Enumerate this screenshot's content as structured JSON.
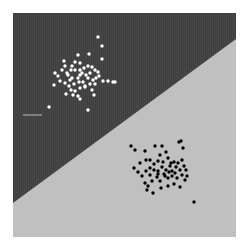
{
  "chart_data": {
    "type": "scatter",
    "title": "",
    "xlabel": "",
    "ylabel": "",
    "grid": false,
    "legend": null,
    "xlim": [
      0,
      10
    ],
    "ylim": [
      0,
      10
    ],
    "plot_box_px": {
      "x0": 13,
      "y0": 13,
      "x1": 236,
      "y1": 237
    },
    "decision_boundary": {
      "description": "linear boundary from lower-left to upper-right",
      "left_edge_y_px": 203,
      "right_edge_y_px": 39
    },
    "regions": [
      {
        "name": "upper-left",
        "color": "#404040"
      },
      {
        "name": "lower-right",
        "color": "#c0c0c0"
      }
    ],
    "annotation_line": {
      "x0_px": 23,
      "x1_px": 42,
      "y_px": 115,
      "color": "#bbbbbb"
    },
    "series": [
      {
        "name": "class_white",
        "color": "#ffffff",
        "points_px": [
          [
            98,
            37
          ],
          [
            102,
            46
          ],
          [
            102,
            59
          ],
          [
            78,
            55
          ],
          [
            89,
            54
          ],
          [
            113,
            82
          ],
          [
            115,
            82
          ],
          [
            108,
            81
          ],
          [
            64,
            61
          ],
          [
            75,
            62
          ],
          [
            72,
            66
          ],
          [
            80,
            63
          ],
          [
            62,
            70
          ],
          [
            55,
            73
          ],
          [
            58,
            76
          ],
          [
            67,
            73
          ],
          [
            71,
            70
          ],
          [
            75,
            70
          ],
          [
            80,
            70
          ],
          [
            84,
            68
          ],
          [
            88,
            66
          ],
          [
            92,
            67
          ],
          [
            95,
            70
          ],
          [
            98,
            72
          ],
          [
            60,
            81
          ],
          [
            54,
            85
          ],
          [
            65,
            83
          ],
          [
            70,
            80
          ],
          [
            72,
            78
          ],
          [
            78,
            78
          ],
          [
            80,
            75
          ],
          [
            82,
            73
          ],
          [
            86,
            75
          ],
          [
            88,
            78
          ],
          [
            90,
            73
          ],
          [
            93,
            80
          ],
          [
            96,
            78
          ],
          [
            99,
            76
          ],
          [
            103,
            81
          ],
          [
            69,
            86
          ],
          [
            71,
            90
          ],
          [
            75,
            91
          ],
          [
            80,
            88
          ],
          [
            85,
            86
          ],
          [
            79,
            82
          ],
          [
            74,
            84
          ],
          [
            66,
            94
          ],
          [
            73,
            95
          ],
          [
            78,
            96
          ],
          [
            85,
            87
          ],
          [
            92,
            90
          ],
          [
            94,
            95
          ],
          [
            80,
            99
          ],
          [
            49,
            107
          ],
          [
            88,
            110
          ],
          [
            65,
            66
          ],
          [
            68,
            75
          ],
          [
            83,
            82
          ],
          [
            90,
            84
          ],
          [
            95,
            84
          ]
        ]
      },
      {
        "name": "class_black",
        "color": "#000000",
        "points_px": [
          [
            131,
            146
          ],
          [
            135,
            150
          ],
          [
            145,
            151
          ],
          [
            155,
            146
          ],
          [
            162,
            146
          ],
          [
            166,
            152
          ],
          [
            160,
            155
          ],
          [
            179,
            142
          ],
          [
            183,
            148
          ],
          [
            181,
            141
          ],
          [
            146,
            160
          ],
          [
            150,
            160
          ],
          [
            154,
            164
          ],
          [
            158,
            161
          ],
          [
            163,
            162
          ],
          [
            168,
            158
          ],
          [
            174,
            162
          ],
          [
            178,
            163
          ],
          [
            182,
            160
          ],
          [
            184,
            166
          ],
          [
            134,
            168
          ],
          [
            138,
            172
          ],
          [
            142,
            176
          ],
          [
            146,
            171
          ],
          [
            150,
            168
          ],
          [
            154,
            170
          ],
          [
            158,
            171
          ],
          [
            162,
            167
          ],
          [
            166,
            170
          ],
          [
            170,
            166
          ],
          [
            172,
            171
          ],
          [
            175,
            173
          ],
          [
            180,
            170
          ],
          [
            186,
            170
          ],
          [
            140,
            163
          ],
          [
            145,
            183
          ],
          [
            148,
            186
          ],
          [
            152,
            181
          ],
          [
            157,
            177
          ],
          [
            160,
            181
          ],
          [
            164,
            174
          ],
          [
            168,
            178
          ],
          [
            172,
            176
          ],
          [
            177,
            178
          ],
          [
            182,
            175
          ],
          [
            187,
            176
          ],
          [
            161,
            188
          ],
          [
            168,
            186
          ],
          [
            174,
            184
          ],
          [
            180,
            187
          ],
          [
            147,
            190
          ],
          [
            153,
            193
          ],
          [
            194,
            202
          ],
          [
            165,
            176
          ],
          [
            169,
            172
          ],
          [
            158,
            174
          ],
          [
            150,
            175
          ],
          [
            185,
            180
          ],
          [
            176,
            167
          ],
          [
            171,
            163
          ]
        ]
      }
    ]
  }
}
